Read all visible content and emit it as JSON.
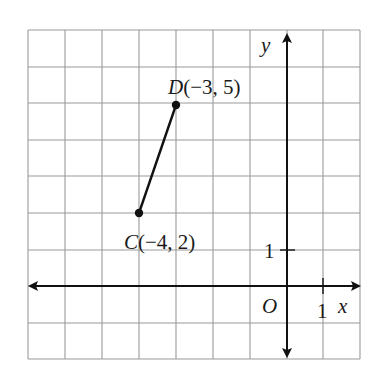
{
  "diagram": {
    "type": "coordinate-plane",
    "grid": {
      "x_min": -7,
      "x_max": 2,
      "y_min": -2,
      "y_max": 7,
      "columns": 9,
      "rows": 9
    },
    "axes": {
      "x_label": "x",
      "y_label": "y",
      "origin_label": "O",
      "x_unit_label": "1",
      "y_unit_label": "1"
    },
    "points": [
      {
        "name": "D",
        "coords": "(−3, 5)",
        "x": -3,
        "y": 5
      },
      {
        "name": "C",
        "coords": "(−4, 2)",
        "x": -4,
        "y": 2
      }
    ],
    "segment": {
      "from": "C",
      "to": "D"
    }
  },
  "colors": {
    "grid": "#9a9a9a",
    "axis": "#111111",
    "text": "#1a1a1a",
    "background": "#ffffff"
  }
}
